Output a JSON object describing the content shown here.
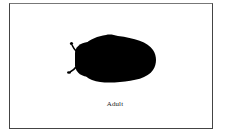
{
  "figure": {
    "caption": "Adult",
    "border_color": "#444444",
    "silhouette_color": "#000000",
    "icon": "beetle-silhouette"
  }
}
